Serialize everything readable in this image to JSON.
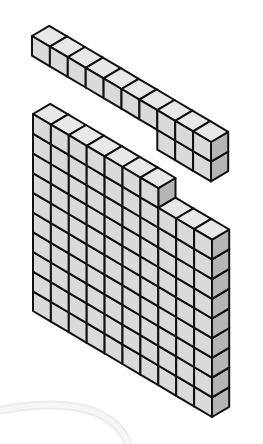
{
  "figure": {
    "description": "Isometric base-ten blocks: a rod of ten unit cubes with three extra cubes beneath its right end, above a flat of cubes with a stepped corner",
    "colors": {
      "front": "#dadada",
      "top": "#e8e8e8",
      "side": "#b5b5b5",
      "edge": "#111111",
      "background": "#ffffff",
      "watermark": "#ececec"
    }
  },
  "geometry": {
    "width_vector": [
      17.9,
      10.6
    ],
    "depth_vector": [
      17.2,
      -10.2
    ],
    "unit_height": 19.7
  },
  "blocks": [
    {
      "name": "rod-block",
      "origin": [
        32,
        36
      ],
      "column_heights": [
        1,
        1,
        1,
        1,
        1,
        1,
        1,
        2,
        2,
        2
      ],
      "column_top_offsets": [
        0,
        0,
        0,
        0,
        0,
        0,
        0,
        0,
        0,
        0
      ]
    },
    {
      "name": "flat-block",
      "origin": [
        33,
        114
      ],
      "column_heights": [
        10,
        10,
        10,
        10,
        10,
        10,
        10,
        9,
        9,
        9
      ],
      "column_top_offsets": [
        0,
        0,
        0,
        0,
        0,
        0,
        0,
        1,
        1,
        1
      ]
    }
  ],
  "counts": {
    "rod_cubes": 13,
    "flat_cubes": 97
  }
}
